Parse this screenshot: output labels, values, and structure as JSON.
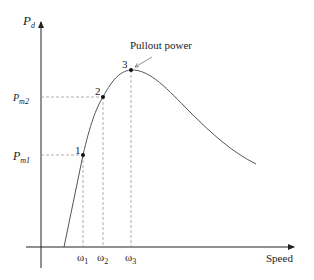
{
  "diagram": {
    "y_axis_label": {
      "main": "P",
      "sub": "d"
    },
    "x_axis_label": "Speed",
    "annotation": "Pullout power",
    "y_ticks": [
      {
        "main": "P",
        "sub": "m1"
      },
      {
        "main": "P",
        "sub": "m2"
      }
    ],
    "x_ticks": [
      {
        "main": "ω",
        "sub": "1"
      },
      {
        "main": "ω",
        "sub": "2"
      },
      {
        "main": "ω",
        "sub": "3"
      }
    ],
    "points": [
      {
        "label": "1"
      },
      {
        "label": "2"
      },
      {
        "label": "3"
      }
    ],
    "colors": {
      "axis": "#222222",
      "curve": "#555555",
      "dash": "#999999"
    }
  }
}
